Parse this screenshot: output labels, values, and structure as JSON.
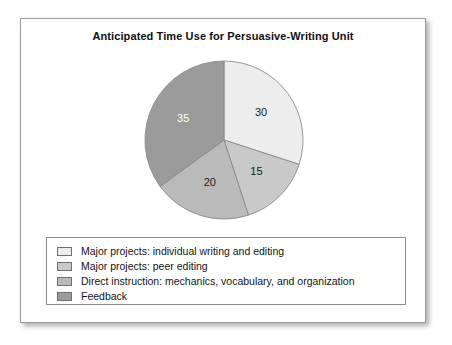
{
  "card": {
    "title": "Anticipated Time Use for Persuasive-Writing Unit"
  },
  "chart_data": {
    "type": "pie",
    "title": "Anticipated Time Use for Persuasive-Writing Unit",
    "categories": [
      "Major projects: individual writing and editing",
      "Major projects: peer editing",
      "Direct instruction: mechanics, vocabulary, and organization",
      "Feedback"
    ],
    "values": [
      30,
      15,
      20,
      35
    ],
    "value_labels": [
      "30",
      "15",
      "20",
      "35"
    ],
    "colors": [
      "#ededed",
      "#c9c9c9",
      "#bababa",
      "#9b9b9b"
    ],
    "label_colors": [
      "#1a1a1a",
      "#1a1a1a",
      "#1a1a1a",
      "#ffffff"
    ],
    "start_angle_deg": 0,
    "direction": "clockwise",
    "total": 100,
    "legend_position": "bottom",
    "grid": false,
    "xlabel": "",
    "ylabel": ""
  },
  "legend": {
    "items": [
      {
        "label": "Major projects: individual writing and editing",
        "color": "#ededed"
      },
      {
        "label": "Major projects: peer editing",
        "color": "#c9c9c9"
      },
      {
        "label": "Direct instruction: mechanics, vocabulary, and organization",
        "color": "#bababa"
      },
      {
        "label": "Feedback",
        "color": "#9b9b9b"
      }
    ]
  }
}
